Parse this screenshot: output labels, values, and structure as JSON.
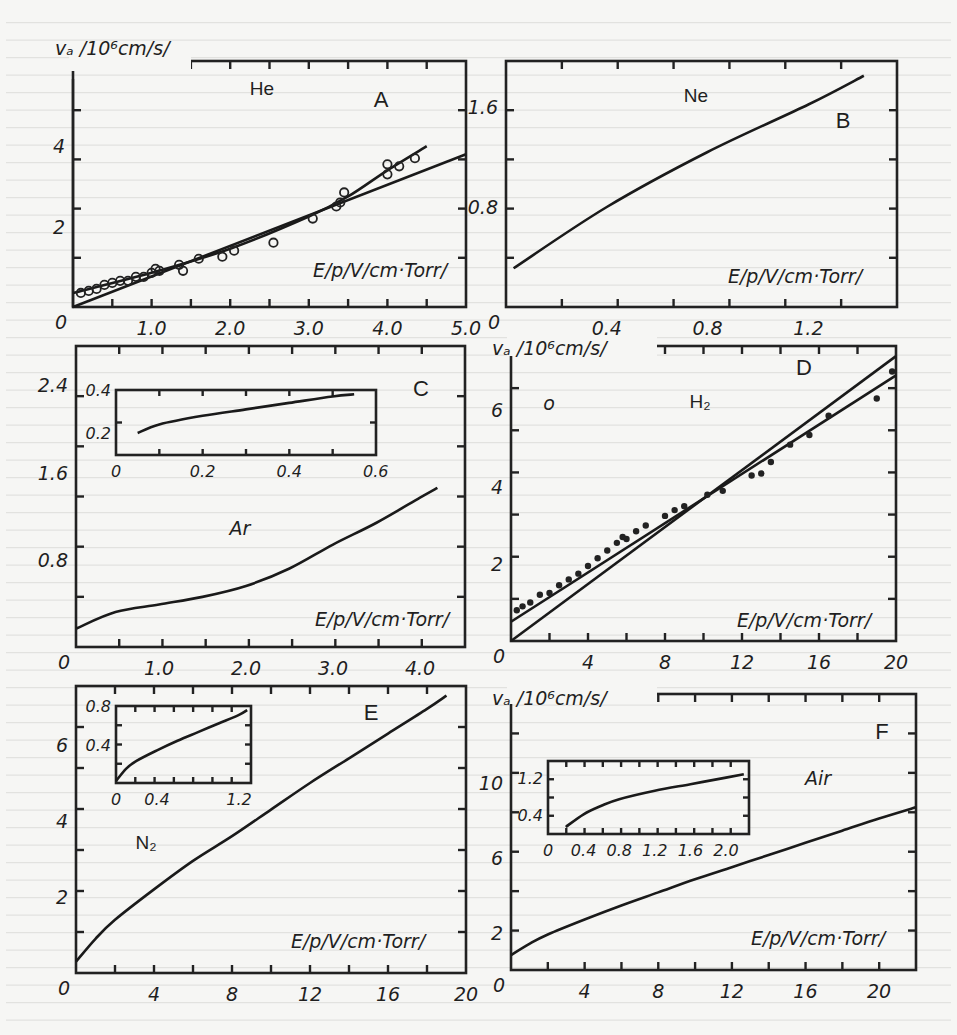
{
  "figure": {
    "y_unit_label": "vₐ /10⁶cm/s/",
    "x_unit_label": "E/p/V/cm·Torr/",
    "ink_color": "#1a1a1a",
    "paper_color": "#f6f6f4"
  },
  "panels": [
    {
      "letter": "A",
      "gas": "He",
      "x_ticks": [
        "1.0",
        "2.0",
        "3.0",
        "4.0",
        "5.0"
      ],
      "y_ticks": [
        "0",
        "2",
        "4"
      ],
      "x_zero": "0"
    },
    {
      "letter": "B",
      "gas": "Ne",
      "x_ticks": [
        "0.4",
        "0.8",
        "1.2"
      ],
      "y_ticks": [
        "0",
        "0.8",
        "1.6"
      ],
      "x_zero": "0"
    },
    {
      "letter": "C",
      "gas": "Ar",
      "x_ticks": [
        "1.0",
        "2.0",
        "3.0",
        "4.0"
      ],
      "y_ticks": [
        "0",
        "0.8",
        "1.6",
        "2.4"
      ],
      "x_zero": "0",
      "inset": {
        "x_ticks": [
          "0",
          "0.2",
          "0.4",
          "0.6"
        ],
        "y_ticks": [
          "0.2",
          "0.4"
        ]
      }
    },
    {
      "letter": "D",
      "gas": "H₂",
      "x_ticks": [
        "4",
        "8",
        "12",
        "16",
        "20"
      ],
      "y_ticks": [
        "0",
        "2",
        "4",
        "6"
      ],
      "x_zero": "0",
      "stray_mark": "o"
    },
    {
      "letter": "E",
      "gas": "N₂",
      "x_ticks": [
        "4",
        "8",
        "12",
        "16",
        "20"
      ],
      "y_ticks": [
        "0",
        "2",
        "4",
        "6"
      ],
      "x_zero": "0",
      "inset": {
        "x_ticks": [
          "0",
          "0.4",
          "1.2"
        ],
        "y_ticks": [
          "0.4",
          "0.8"
        ]
      }
    },
    {
      "letter": "F",
      "gas": "Air",
      "x_ticks": [
        "4",
        "8",
        "12",
        "16",
        "20"
      ],
      "y_ticks": [
        "0",
        "2",
        "6",
        "10"
      ],
      "x_zero": "0",
      "inset": {
        "x_ticks": [
          "0",
          "0.4",
          "0.8",
          "1.2",
          "1.6",
          "2.0"
        ],
        "y_ticks": [
          "0.4",
          "1.2"
        ]
      }
    }
  ],
  "chart_data": [
    {
      "type": "scatter",
      "panel": "A",
      "title": "He",
      "xlabel": "E/p [V/cm·Torr]",
      "ylabel": "v_d [10^6 cm/s]",
      "xlim": [
        0,
        5.0
      ],
      "ylim": [
        0,
        6
      ],
      "x_ticks": [
        1.0,
        2.0,
        3.0,
        4.0,
        5.0
      ],
      "y_ticks": [
        0,
        2,
        4
      ],
      "series": [
        {
          "name": "line 1 (linear)",
          "kind": "line",
          "x": [
            0,
            5.0
          ],
          "y": [
            0,
            3.8
          ]
        },
        {
          "name": "line 2 (fit through data)",
          "kind": "line",
          "x": [
            0,
            1.0,
            2.0,
            3.0,
            3.5,
            4.0,
            4.5
          ],
          "y": [
            0.35,
            0.85,
            1.45,
            2.25,
            2.75,
            3.4,
            4.0
          ]
        },
        {
          "name": "data (open circles)",
          "kind": "scatter",
          "x": [
            0.1,
            0.2,
            0.3,
            0.4,
            0.5,
            0.6,
            0.7,
            0.8,
            0.9,
            1.0,
            1.05,
            1.1,
            1.35,
            1.4,
            1.6,
            1.9,
            2.05,
            2.55,
            3.05,
            3.35,
            3.4,
            3.45,
            4.0,
            4.0,
            4.15,
            4.35
          ],
          "y": [
            0.35,
            0.4,
            0.45,
            0.55,
            0.6,
            0.65,
            0.65,
            0.75,
            0.75,
            0.85,
            0.95,
            0.9,
            1.05,
            0.9,
            1.2,
            1.25,
            1.4,
            1.6,
            2.2,
            2.5,
            2.6,
            2.85,
            3.3,
            3.55,
            3.5,
            3.7
          ]
        }
      ]
    },
    {
      "type": "line",
      "panel": "B",
      "title": "Ne",
      "xlabel": "E/p [V/cm·Torr]",
      "ylabel": "v_d [10^6 cm/s]",
      "xlim": [
        0,
        1.55
      ],
      "ylim": [
        0,
        1.95
      ],
      "x_ticks": [
        0.4,
        0.8,
        1.2
      ],
      "y_ticks": [
        0,
        0.8,
        1.6
      ],
      "series": [
        {
          "name": "Ne",
          "x": [
            0.03,
            0.4,
            0.8,
            1.2,
            1.42
          ],
          "y": [
            0.31,
            0.8,
            1.24,
            1.62,
            1.85
          ]
        }
      ]
    },
    {
      "type": "line",
      "panel": "C",
      "title": "Ar",
      "xlabel": "E/p [V/cm·Torr]",
      "ylabel": "v_d [10^6 cm/s]",
      "xlim": [
        0,
        4.5
      ],
      "ylim": [
        0,
        2.8
      ],
      "x_ticks": [
        1.0,
        2.0,
        3.0,
        4.0
      ],
      "y_ticks": [
        0,
        0.8,
        1.6,
        2.4
      ],
      "series": [
        {
          "name": "Ar",
          "x": [
            0.05,
            0.5,
            1.0,
            1.5,
            2.0,
            2.5,
            3.0,
            3.5,
            4.0,
            4.2
          ],
          "y": [
            0.17,
            0.32,
            0.39,
            0.46,
            0.56,
            0.72,
            0.94,
            1.14,
            1.37,
            1.46
          ]
        }
      ],
      "inset": {
        "xlim": [
          0,
          0.6
        ],
        "ylim": [
          0.1,
          0.4
        ],
        "x_ticks": [
          0,
          0.2,
          0.4,
          0.6
        ],
        "y_ticks": [
          0.2,
          0.4
        ],
        "series": [
          {
            "name": "Ar low E/p",
            "x": [
              0.05,
              0.1,
              0.2,
              0.3,
              0.4,
              0.5,
              0.55
            ],
            "y": [
              0.2,
              0.24,
              0.28,
              0.31,
              0.34,
              0.37,
              0.38
            ]
          }
        ]
      }
    },
    {
      "type": "scatter",
      "panel": "D",
      "title": "H2",
      "xlabel": "E/p [V/cm·Torr]",
      "ylabel": "v_d [10^6 cm/s]",
      "xlim": [
        0,
        20
      ],
      "ylim": [
        0,
        7.7
      ],
      "x_ticks": [
        4,
        8,
        12,
        16,
        20
      ],
      "y_ticks": [
        0,
        2,
        4,
        6
      ],
      "series": [
        {
          "name": "line 1 (through origin)",
          "kind": "line",
          "x": [
            0,
            20
          ],
          "y": [
            0,
            7.4
          ]
        },
        {
          "name": "line 2 (fit through data)",
          "kind": "line",
          "x": [
            0,
            20
          ],
          "y": [
            0.5,
            6.9
          ]
        },
        {
          "name": "data (filled points)",
          "kind": "scatter",
          "x": [
            0.3,
            0.6,
            1.0,
            1.5,
            2.0,
            2.5,
            3.0,
            3.5,
            4.0,
            4.5,
            5.0,
            5.5,
            5.8,
            6.0,
            6.5,
            7.0,
            8.0,
            8.5,
            9.0,
            10.2,
            11.0,
            12.5,
            13.0,
            13.5,
            14.5,
            15.5,
            16.5,
            19.0,
            19.8
          ],
          "y": [
            0.8,
            0.9,
            1.0,
            1.2,
            1.25,
            1.45,
            1.6,
            1.75,
            1.95,
            2.15,
            2.35,
            2.55,
            2.7,
            2.65,
            2.85,
            3.0,
            3.25,
            3.4,
            3.5,
            3.8,
            3.9,
            4.3,
            4.35,
            4.65,
            5.1,
            5.35,
            5.85,
            6.3,
            7.0
          ]
        }
      ]
    },
    {
      "type": "line",
      "panel": "E",
      "title": "N2",
      "xlabel": "E/p [V/cm·Torr]",
      "ylabel": "v_d [10^6 cm/s]",
      "xlim": [
        0,
        20
      ],
      "ylim": [
        0,
        7.5
      ],
      "x_ticks": [
        4,
        8,
        12,
        16,
        20
      ],
      "y_ticks": [
        0,
        2,
        4,
        6
      ],
      "series": [
        {
          "name": "N2",
          "x": [
            0,
            1,
            2,
            4,
            6,
            8,
            10,
            12,
            14,
            16,
            18,
            19
          ],
          "y": [
            0.3,
            0.9,
            1.4,
            2.2,
            2.95,
            3.6,
            4.3,
            5.0,
            5.65,
            6.3,
            6.95,
            7.3
          ]
        }
      ],
      "inset": {
        "xlim": [
          0,
          1.4
        ],
        "ylim": [
          0,
          0.8
        ],
        "x_ticks": [
          0,
          0.4,
          1.2
        ],
        "y_ticks": [
          0.4,
          0.8
        ],
        "series": [
          {
            "name": "N2 low E/p",
            "x": [
              0,
              0.1,
              0.2,
              0.4,
              0.6,
              0.8,
              1.0,
              1.2,
              1.28
            ],
            "y": [
              0.02,
              0.15,
              0.23,
              0.34,
              0.44,
              0.53,
              0.62,
              0.71,
              0.76
            ]
          }
        ]
      }
    },
    {
      "type": "line",
      "panel": "F",
      "title": "Air",
      "xlabel": "E/p [V/cm·Torr]",
      "ylabel": "v_d [10^6 cm/s]",
      "xlim": [
        0,
        22
      ],
      "ylim": [
        0,
        14.5
      ],
      "x_ticks": [
        4,
        8,
        12,
        16,
        20
      ],
      "y_ticks": [
        0,
        2,
        6,
        10
      ],
      "series": [
        {
          "name": "Air",
          "x": [
            0,
            1,
            2,
            4,
            6,
            8,
            10,
            12,
            14,
            16,
            18,
            20,
            22
          ],
          "y": [
            0.8,
            1.4,
            1.9,
            2.7,
            3.45,
            4.15,
            4.85,
            5.5,
            6.15,
            6.8,
            7.45,
            8.1,
            8.7
          ]
        }
      ],
      "inset": {
        "xlim": [
          0,
          2.2
        ],
        "ylim": [
          0,
          1.6
        ],
        "x_ticks": [
          0,
          0.4,
          0.8,
          1.2,
          1.6,
          2.0
        ],
        "y_ticks": [
          0.4,
          1.2
        ],
        "series": [
          {
            "name": "Air low E/p",
            "x": [
              0.2,
              0.4,
              0.6,
              0.8,
              1.2,
              1.6,
              2.0,
              2.2
            ],
            "y": [
              0.15,
              0.42,
              0.6,
              0.74,
              0.92,
              1.06,
              1.2,
              1.27
            ]
          }
        ]
      }
    }
  ]
}
